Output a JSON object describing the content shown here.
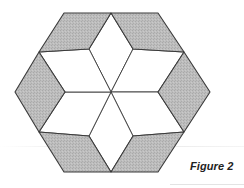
{
  "caption": "Figure 2",
  "colors": {
    "shaded": "#b9b9b9",
    "unshaded": "#ffffff",
    "stroke": "#3a3a3a"
  },
  "figure": {
    "shaded_rhombi": [
      "64,13 111,13 89,49 39,52",
      "111,13 158,13 184,52 133,49",
      "184,52 210,92 184,132 158,92",
      "133,136 184,132 158,172 111,172",
      "39,132 89,136 111,172 64,172",
      "39,52 65,92 39,132 15,92"
    ],
    "white_rhombi": [
      "111,92 89,49 111,13 133,49",
      "111,92 133,49 184,52 158,92",
      "111,92 158,92 184,132 133,136",
      "111,92 133,136 111,172 89,136",
      "111,92 89,136 39,132 65,92",
      "111,92 65,92 39,52 89,49"
    ]
  }
}
